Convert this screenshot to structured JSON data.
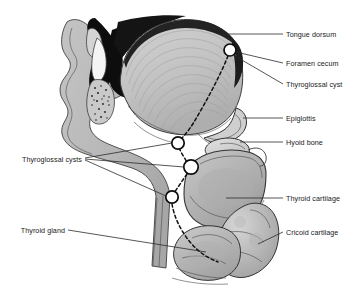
{
  "figure": {
    "background_color": "#ffffff",
    "width": 359,
    "height": 285
  },
  "labels": {
    "right": [
      {
        "id": "tongue-dorsum",
        "text": "Tongue dorsum"
      },
      {
        "id": "foramen-cecum",
        "text": "Foramen cecum"
      },
      {
        "id": "thyroglossal-cyst",
        "text": "Thyroglossal cyst"
      },
      {
        "id": "epiglottis",
        "text": "Epiglottis"
      },
      {
        "id": "hyoid-bone",
        "text": "Hyoid bone"
      },
      {
        "id": "thyroid-cartilage",
        "text": "Thyroid cartilage"
      },
      {
        "id": "cricoid-cartilage",
        "text": "Cricoid cartilage"
      }
    ],
    "left": [
      {
        "id": "thyroglossal-cysts",
        "text": "Thyroglossal cysts"
      },
      {
        "id": "thyroid-gland",
        "text": "Thyroid gland"
      }
    ]
  },
  "markers": {
    "description": "White circles marking cyst positions along the thyroglossal duct tract",
    "count": 4,
    "fill_color": "#ffffff",
    "stroke_color": "#0d0d0d",
    "points": [
      {
        "id": "cyst-foramen-cecum",
        "x": 230,
        "y": 50,
        "r": 6.0
      },
      {
        "id": "cyst-suprahyoid",
        "x": 178,
        "y": 143,
        "r": 6.2
      },
      {
        "id": "cyst-infrahyoid",
        "x": 191,
        "y": 167,
        "r": 7.2
      },
      {
        "id": "cyst-thyroid-level",
        "x": 172,
        "y": 197,
        "r": 6.2
      }
    ]
  },
  "anatomy": {
    "regions": [
      {
        "id": "nasal-oral-cavity",
        "name": "Nasal and oral cavity airspace",
        "color": "#111111"
      },
      {
        "id": "tongue-body",
        "name": "Tongue body (genioglossus)",
        "color": "#c6c6c6"
      },
      {
        "id": "tongue-dorsum",
        "name": "Tongue dorsum mucosa",
        "color": "#2a2a2a"
      },
      {
        "id": "soft-tissue",
        "name": "Facial and neck soft tissue",
        "color": "#b9b9b9"
      },
      {
        "id": "hyoid-bone",
        "name": "Hyoid bone",
        "color": "#d8d8d8"
      },
      {
        "id": "thyroid-cartilage",
        "name": "Thyroid cartilage",
        "color": "#b3b3b3"
      },
      {
        "id": "cricoid-cartilage",
        "name": "Cricoid cartilage",
        "color": "#a8a8a8"
      },
      {
        "id": "thyroid-gland",
        "name": "Thyroid gland",
        "color": "#bdbdbd"
      },
      {
        "id": "epiglottis",
        "name": "Epiglottis",
        "color": "#cfcfcf"
      },
      {
        "id": "incisor-tooth",
        "name": "Incisor tooth",
        "color": "#f2f2f2"
      }
    ],
    "tract": {
      "id": "thyroglossal-duct-tract",
      "name": "Thyroglossal duct descent path",
      "style": "dashed",
      "color": "#111111"
    }
  }
}
